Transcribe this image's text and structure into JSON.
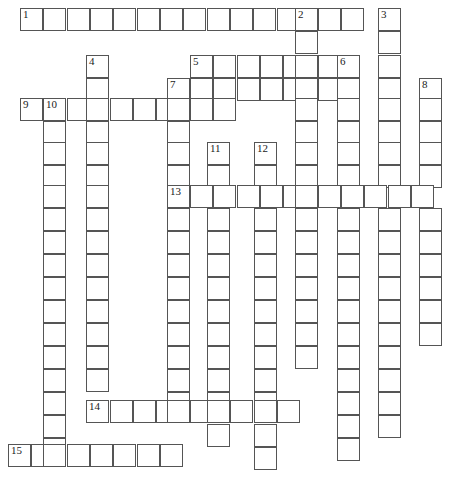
{
  "puzzle": {
    "title": "Crossword Grid",
    "grid": {
      "origin_x": 20,
      "origin_y": 8,
      "cell_size": 23.3,
      "rows": 20,
      "cols": 19,
      "line_color": "#555555",
      "cell_fill": "#ffffff",
      "background": "#ffffff"
    },
    "entries": [
      {
        "number": "1",
        "direction": "across",
        "row": 0,
        "col": 0,
        "length": 14
      },
      {
        "number": "2",
        "direction": "down",
        "row": 0,
        "col": 12,
        "length": 19
      },
      {
        "number": "3",
        "direction": "down",
        "row": 0,
        "col": 15,
        "length": 19
      },
      {
        "number": "4",
        "direction": "down",
        "row": 2,
        "col": 3,
        "length": 14
      },
      {
        "number": "5",
        "direction": "across",
        "row": 2,
        "col": 7,
        "length": 7
      },
      {
        "number": "6",
        "direction": "down",
        "row": 2,
        "col": 14,
        "length": 18
      },
      {
        "number": "7",
        "direction": "down",
        "row": 3,
        "col": 6,
        "length": 13
      },
      {
        "number": "8",
        "direction": "down",
        "row": 3,
        "col": 18,
        "length": 12
      },
      {
        "number": "9",
        "direction": "across",
        "row": 4,
        "col": -1,
        "length": 7
      },
      {
        "number": "10",
        "direction": "down",
        "row": 4,
        "col": 1,
        "length": 16
      },
      {
        "number": "11",
        "direction": "down",
        "row": 6,
        "col": 8,
        "length": 14
      },
      {
        "number": "12",
        "direction": "down",
        "row": 6,
        "col": 10,
        "length": 15
      },
      {
        "number": "13",
        "direction": "across",
        "row": 8,
        "col": 6,
        "length": 12
      },
      {
        "number": "14",
        "direction": "across",
        "row": 17,
        "col": 3,
        "length": 10
      },
      {
        "number": "15",
        "direction": "across",
        "row": 19,
        "col": -1,
        "length": 9
      }
    ],
    "cells": [
      {
        "x": 20,
        "y": 8,
        "n": "1"
      },
      {
        "x": 43,
        "y": 8
      },
      {
        "x": 67,
        "y": 8
      },
      {
        "x": 90,
        "y": 8
      },
      {
        "x": 113,
        "y": 8
      },
      {
        "x": 137,
        "y": 8
      },
      {
        "x": 160,
        "y": 8
      },
      {
        "x": 183,
        "y": 8
      },
      {
        "x": 207,
        "y": 8
      },
      {
        "x": 230,
        "y": 8
      },
      {
        "x": 253,
        "y": 8
      },
      {
        "x": 277,
        "y": 8
      },
      {
        "x": 295,
        "y": 8,
        "n": "2"
      },
      {
        "x": 318,
        "y": 8
      },
      {
        "x": 341,
        "y": 8
      },
      {
        "x": 378,
        "y": 8,
        "n": "3"
      },
      {
        "x": 295,
        "y": 31
      },
      {
        "x": 378,
        "y": 31
      },
      {
        "x": 86,
        "y": 55,
        "n": "4"
      },
      {
        "x": 190,
        "y": 55,
        "n": "5"
      },
      {
        "x": 213,
        "y": 55
      },
      {
        "x": 237,
        "y": 55
      },
      {
        "x": 260,
        "y": 55
      },
      {
        "x": 283,
        "y": 55
      },
      {
        "x": 295,
        "y": 55
      },
      {
        "x": 318,
        "y": 55
      },
      {
        "x": 337,
        "y": 55,
        "n": "6"
      },
      {
        "x": 378,
        "y": 55
      },
      {
        "x": 86,
        "y": 78
      },
      {
        "x": 167,
        "y": 78,
        "n": "7"
      },
      {
        "x": 190,
        "y": 78
      },
      {
        "x": 213,
        "y": 78
      },
      {
        "x": 237,
        "y": 78
      },
      {
        "x": 260,
        "y": 78
      },
      {
        "x": 283,
        "y": 78
      },
      {
        "x": 295,
        "y": 78
      },
      {
        "x": 318,
        "y": 78
      },
      {
        "x": 337,
        "y": 78
      },
      {
        "x": 378,
        "y": 78
      },
      {
        "x": 419,
        "y": 78,
        "n": "8"
      },
      {
        "x": 20,
        "y": 98,
        "n": "9"
      },
      {
        "x": 43,
        "y": 98,
        "n": "10"
      },
      {
        "x": 67,
        "y": 98
      },
      {
        "x": 86,
        "y": 98
      },
      {
        "x": 110,
        "y": 98
      },
      {
        "x": 133,
        "y": 98
      },
      {
        "x": 156,
        "y": 98
      },
      {
        "x": 167,
        "y": 98
      },
      {
        "x": 190,
        "y": 98
      },
      {
        "x": 213,
        "y": 98
      },
      {
        "x": 295,
        "y": 98
      },
      {
        "x": 337,
        "y": 98
      },
      {
        "x": 378,
        "y": 98
      },
      {
        "x": 419,
        "y": 98
      },
      {
        "x": 43,
        "y": 121
      },
      {
        "x": 86,
        "y": 121
      },
      {
        "x": 167,
        "y": 121
      },
      {
        "x": 295,
        "y": 121
      },
      {
        "x": 337,
        "y": 121
      },
      {
        "x": 378,
        "y": 121
      },
      {
        "x": 419,
        "y": 121
      },
      {
        "x": 43,
        "y": 142
      },
      {
        "x": 86,
        "y": 142
      },
      {
        "x": 167,
        "y": 142
      },
      {
        "x": 207,
        "y": 142,
        "n": "11"
      },
      {
        "x": 254,
        "y": 142,
        "n": "12"
      },
      {
        "x": 295,
        "y": 142
      },
      {
        "x": 337,
        "y": 142
      },
      {
        "x": 378,
        "y": 142
      },
      {
        "x": 419,
        "y": 142
      },
      {
        "x": 43,
        "y": 165
      },
      {
        "x": 86,
        "y": 165
      },
      {
        "x": 167,
        "y": 165
      },
      {
        "x": 207,
        "y": 165
      },
      {
        "x": 254,
        "y": 165
      },
      {
        "x": 295,
        "y": 165
      },
      {
        "x": 337,
        "y": 165
      },
      {
        "x": 378,
        "y": 165
      },
      {
        "x": 419,
        "y": 165
      },
      {
        "x": 167,
        "y": 185,
        "n": "13"
      },
      {
        "x": 190,
        "y": 185
      },
      {
        "x": 213,
        "y": 185
      },
      {
        "x": 237,
        "y": 185
      },
      {
        "x": 260,
        "y": 185
      },
      {
        "x": 283,
        "y": 185
      },
      {
        "x": 295,
        "y": 185
      },
      {
        "x": 318,
        "y": 185
      },
      {
        "x": 341,
        "y": 185
      },
      {
        "x": 364,
        "y": 185
      },
      {
        "x": 388,
        "y": 185
      },
      {
        "x": 411,
        "y": 185
      },
      {
        "x": 43,
        "y": 185
      },
      {
        "x": 86,
        "y": 185
      },
      {
        "x": 43,
        "y": 208
      },
      {
        "x": 86,
        "y": 208
      },
      {
        "x": 167,
        "y": 208
      },
      {
        "x": 207,
        "y": 208
      },
      {
        "x": 254,
        "y": 208
      },
      {
        "x": 295,
        "y": 208
      },
      {
        "x": 337,
        "y": 208
      },
      {
        "x": 378,
        "y": 208
      },
      {
        "x": 419,
        "y": 208
      },
      {
        "x": 43,
        "y": 231
      },
      {
        "x": 86,
        "y": 231
      },
      {
        "x": 167,
        "y": 231
      },
      {
        "x": 207,
        "y": 231
      },
      {
        "x": 254,
        "y": 231
      },
      {
        "x": 295,
        "y": 231
      },
      {
        "x": 337,
        "y": 231
      },
      {
        "x": 378,
        "y": 231
      },
      {
        "x": 419,
        "y": 231
      },
      {
        "x": 43,
        "y": 254
      },
      {
        "x": 86,
        "y": 254
      },
      {
        "x": 167,
        "y": 254
      },
      {
        "x": 207,
        "y": 254
      },
      {
        "x": 254,
        "y": 254
      },
      {
        "x": 295,
        "y": 254
      },
      {
        "x": 337,
        "y": 254
      },
      {
        "x": 378,
        "y": 254
      },
      {
        "x": 419,
        "y": 254
      },
      {
        "x": 43,
        "y": 277
      },
      {
        "x": 86,
        "y": 277
      },
      {
        "x": 167,
        "y": 277
      },
      {
        "x": 207,
        "y": 277
      },
      {
        "x": 254,
        "y": 277
      },
      {
        "x": 295,
        "y": 277
      },
      {
        "x": 337,
        "y": 277
      },
      {
        "x": 378,
        "y": 277
      },
      {
        "x": 419,
        "y": 277
      },
      {
        "x": 43,
        "y": 300
      },
      {
        "x": 86,
        "y": 300
      },
      {
        "x": 167,
        "y": 300
      },
      {
        "x": 207,
        "y": 300
      },
      {
        "x": 254,
        "y": 300
      },
      {
        "x": 295,
        "y": 300
      },
      {
        "x": 337,
        "y": 300
      },
      {
        "x": 378,
        "y": 300
      },
      {
        "x": 419,
        "y": 300
      },
      {
        "x": 43,
        "y": 323
      },
      {
        "x": 86,
        "y": 323
      },
      {
        "x": 167,
        "y": 323
      },
      {
        "x": 207,
        "y": 323
      },
      {
        "x": 254,
        "y": 323
      },
      {
        "x": 295,
        "y": 323
      },
      {
        "x": 337,
        "y": 323
      },
      {
        "x": 378,
        "y": 323
      },
      {
        "x": 419,
        "y": 323
      },
      {
        "x": 43,
        "y": 346
      },
      {
        "x": 86,
        "y": 346
      },
      {
        "x": 167,
        "y": 346
      },
      {
        "x": 207,
        "y": 346
      },
      {
        "x": 254,
        "y": 346
      },
      {
        "x": 295,
        "y": 346
      },
      {
        "x": 337,
        "y": 346
      },
      {
        "x": 378,
        "y": 346
      },
      {
        "x": 43,
        "y": 369
      },
      {
        "x": 86,
        "y": 369
      },
      {
        "x": 167,
        "y": 369
      },
      {
        "x": 207,
        "y": 369
      },
      {
        "x": 254,
        "y": 369
      },
      {
        "x": 337,
        "y": 369
      },
      {
        "x": 378,
        "y": 369
      },
      {
        "x": 43,
        "y": 392
      },
      {
        "x": 167,
        "y": 392
      },
      {
        "x": 207,
        "y": 392
      },
      {
        "x": 254,
        "y": 392
      },
      {
        "x": 337,
        "y": 392
      },
      {
        "x": 378,
        "y": 392
      },
      {
        "x": 86,
        "y": 400,
        "n": "14"
      },
      {
        "x": 110,
        "y": 400
      },
      {
        "x": 133,
        "y": 400
      },
      {
        "x": 156,
        "y": 400
      },
      {
        "x": 167,
        "y": 400
      },
      {
        "x": 190,
        "y": 400
      },
      {
        "x": 207,
        "y": 400
      },
      {
        "x": 230,
        "y": 400
      },
      {
        "x": 254,
        "y": 400
      },
      {
        "x": 277,
        "y": 400
      },
      {
        "x": 43,
        "y": 415
      },
      {
        "x": 337,
        "y": 415
      },
      {
        "x": 378,
        "y": 415
      },
      {
        "x": 207,
        "y": 424
      },
      {
        "x": 254,
        "y": 424
      },
      {
        "x": 43,
        "y": 438
      },
      {
        "x": 254,
        "y": 447
      },
      {
        "x": 337,
        "y": 438
      },
      {
        "x": 8,
        "y": 444,
        "n": "15"
      },
      {
        "x": 31,
        "y": 444
      },
      {
        "x": 43,
        "y": 444
      },
      {
        "x": 67,
        "y": 444
      },
      {
        "x": 90,
        "y": 444
      },
      {
        "x": 113,
        "y": 444
      },
      {
        "x": 137,
        "y": 444
      },
      {
        "x": 160,
        "y": 444
      }
    ]
  }
}
